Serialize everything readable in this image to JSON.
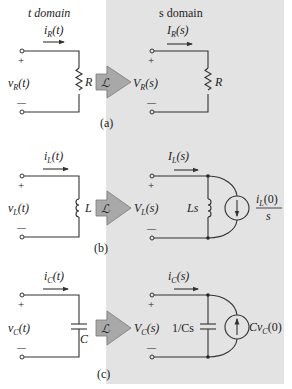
{
  "headers": {
    "t_domain": "t domain",
    "s_domain": "s domain"
  },
  "transform_symbol": "ℒ",
  "colors": {
    "s_panel": "#e3e3e3",
    "arrow_fill": "#a8a8a8",
    "arrow_stroke": "#7a7a7a",
    "wire": "#333333"
  },
  "panels": [
    {
      "id": "a",
      "caption": "(a)",
      "t": {
        "current": "i",
        "current_sub": "R",
        "current_arg": "(t)",
        "voltage": "v",
        "voltage_sub": "R",
        "voltage_arg": "(t)",
        "element": "R",
        "element_type": "resistor"
      },
      "s": {
        "current": "I",
        "current_sub": "R",
        "current_arg": "(s)",
        "voltage": "V",
        "voltage_sub": "R",
        "voltage_arg": "(s)",
        "element": "R",
        "element_type": "resistor"
      }
    },
    {
      "id": "b",
      "caption": "(b)",
      "t": {
        "current": "i",
        "current_sub": "L",
        "current_arg": "(t)",
        "voltage": "v",
        "voltage_sub": "L",
        "voltage_arg": "(t)",
        "element": "L",
        "element_type": "inductor"
      },
      "s": {
        "current": "I",
        "current_sub": "L",
        "current_arg": "(s)",
        "voltage": "V",
        "voltage_sub": "L",
        "voltage_arg": "(s)",
        "element": "Ls",
        "element_type": "inductor",
        "source_num": "i",
        "source_num_sub": "L",
        "source_num_arg": "(0)",
        "source_den": "s",
        "source_direction": "down"
      }
    },
    {
      "id": "c",
      "caption": "(c)",
      "t": {
        "current": "i",
        "current_sub": "C",
        "current_arg": "(t)",
        "voltage": "v",
        "voltage_sub": "C",
        "voltage_arg": "(t)",
        "element": "C",
        "element_type": "capacitor"
      },
      "s": {
        "current": "i",
        "current_sub": "C",
        "current_arg": "(s)",
        "voltage": "V",
        "voltage_sub": "C",
        "voltage_arg": "(s)",
        "element": "1/Cs",
        "element_type": "capacitor",
        "source_label": "Cv",
        "source_sub": "C",
        "source_arg": "(0)",
        "source_direction": "up"
      }
    }
  ],
  "polarity": {
    "plus": "+",
    "minus": "—"
  }
}
